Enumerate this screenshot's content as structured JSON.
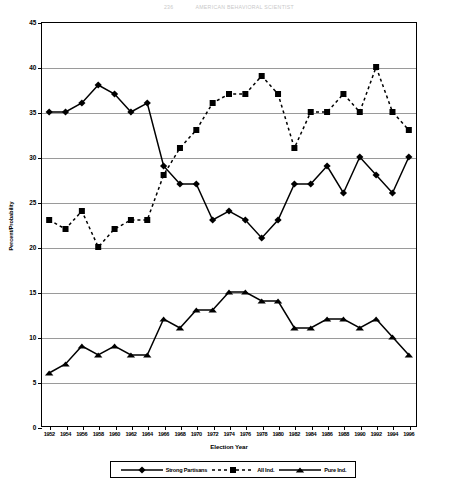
{
  "running_head": {
    "number": "236",
    "text": "AMERICAN BEHAVIORAL SCIENTIST"
  },
  "chart_data": {
    "type": "line",
    "title": "",
    "xlabel": "Election Year",
    "ylabel": "Percent/Probability",
    "ylim": [
      0,
      45
    ],
    "ytick_step": 5,
    "yticks": [
      "0",
      "5",
      "10",
      "15",
      "20",
      "25",
      "30",
      "35",
      "40",
      "45"
    ],
    "grid": true,
    "legend_position": "bottom",
    "categories": [
      "1952",
      "1954",
      "1956",
      "1958",
      "1960",
      "1962",
      "1964",
      "1966",
      "1968",
      "1970",
      "1972",
      "1974",
      "1976",
      "1978",
      "1980",
      "1982",
      "1984",
      "1986",
      "1988",
      "1990",
      "1992",
      "1994",
      "1996"
    ],
    "series": [
      {
        "name": "Strong Partisans",
        "marker": "diamond",
        "line": "solid",
        "color": "#000000",
        "values": [
          35,
          35,
          36,
          38,
          37,
          35,
          36,
          29,
          27,
          27,
          23,
          24,
          23,
          21,
          23,
          27,
          27,
          29,
          26,
          30,
          28,
          26,
          30
        ]
      },
      {
        "name": "All Ind.",
        "marker": "square",
        "line": "dashed",
        "color": "#000000",
        "values": [
          23,
          22,
          24,
          20,
          22,
          23,
          23,
          28,
          31,
          33,
          36,
          37,
          37,
          39,
          37,
          31,
          35,
          35,
          37,
          35,
          40,
          35,
          33
        ]
      },
      {
        "name": "Pure Ind.",
        "marker": "triangle",
        "line": "solid",
        "color": "#000000",
        "values": [
          6,
          7,
          9,
          8,
          9,
          8,
          8,
          12,
          11,
          13,
          13,
          15,
          15,
          14,
          14,
          11,
          11,
          12,
          12,
          11,
          12,
          10,
          8
        ]
      }
    ]
  },
  "legend": {
    "items": [
      {
        "label": "Strong Partisans",
        "marker": "diamond",
        "line": "solid"
      },
      {
        "label": "All Ind.",
        "marker": "square",
        "line": "dashed"
      },
      {
        "label": "Pure Ind.",
        "marker": "triangle",
        "line": "solid"
      }
    ]
  }
}
